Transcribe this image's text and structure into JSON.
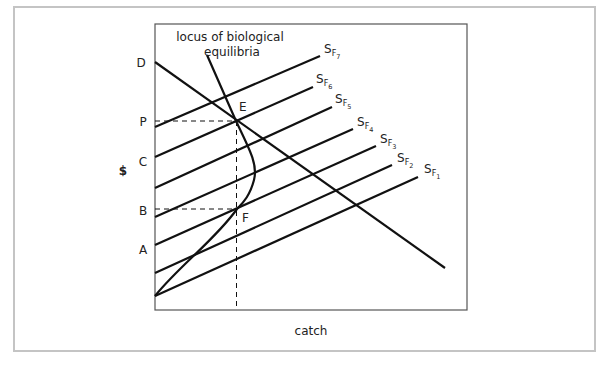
{
  "figure": {
    "type": "economic-diagram",
    "y_axis_label": "$",
    "x_axis_label": "catch",
    "y_tick_labels": [
      "D",
      "P",
      "C",
      "B",
      "A"
    ],
    "annotation": [
      "locus of biological",
      "equilibria"
    ],
    "points": [
      {
        "name": "E",
        "label": "E"
      },
      {
        "name": "F",
        "label": "F"
      }
    ],
    "curves": [
      {
        "name": "demand-line",
        "label": "D"
      },
      {
        "name": "locus-of-biological-equilibria",
        "label": "locus of biological equilibria"
      },
      {
        "name": "supply-F7",
        "base": "S",
        "sub": "F",
        "subsub": "7"
      },
      {
        "name": "supply-F6",
        "base": "S",
        "sub": "F",
        "subsub": "6"
      },
      {
        "name": "supply-F5",
        "base": "S",
        "sub": "F",
        "subsub": "5"
      },
      {
        "name": "supply-F4",
        "base": "S",
        "sub": "F",
        "subsub": "4"
      },
      {
        "name": "supply-F3",
        "base": "S",
        "sub": "F",
        "subsub": "3"
      },
      {
        "name": "supply-F2",
        "base": "S",
        "sub": "F",
        "subsub": "2"
      },
      {
        "name": "supply-F1",
        "base": "S",
        "sub": "F",
        "subsub": "1"
      }
    ],
    "colors": {
      "line": "#111111",
      "frame": "#c4c4c4",
      "axis_box": "#555555"
    }
  }
}
